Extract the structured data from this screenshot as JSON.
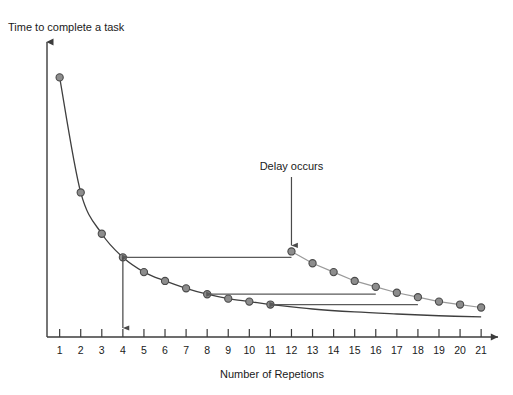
{
  "chart_data": {
    "type": "line",
    "title": "",
    "xlabel": "Number of Repetions",
    "ylabel": "Time to complete a task",
    "xlim": [
      0.4,
      21.8
    ],
    "ylim": [
      0,
      100
    ],
    "grid": false,
    "legend": "none",
    "x_tick_labels": [
      "1",
      "2",
      "3",
      "4",
      "5",
      "6",
      "7",
      "8",
      "9",
      "10",
      "11",
      "12",
      "13",
      "14",
      "15",
      "16",
      "17",
      "18",
      "19",
      "20",
      "21"
    ],
    "y_tick_labels": [],
    "series": [
      {
        "name": "Learning curve",
        "style": "line-with-markers",
        "color": "#3f3f3f",
        "x": [
          1,
          2,
          3,
          4,
          5,
          6,
          7,
          8,
          9,
          10,
          11
        ],
        "values": [
          88,
          49,
          35,
          27,
          22,
          19,
          16.5,
          14.5,
          13,
          12,
          11
        ]
      },
      {
        "name": "Curve after delay",
        "style": "line-with-markers",
        "color": "#9a9a9a",
        "x": [
          12,
          13,
          14,
          15,
          16,
          17,
          18,
          19,
          20,
          21
        ],
        "values": [
          29,
          25,
          22,
          19,
          17,
          15,
          13.5,
          12,
          11,
          10
        ]
      },
      {
        "name": "Continued baseline",
        "style": "line",
        "color": "#3f3f3f",
        "x": [
          11,
          13,
          15,
          17,
          19,
          21
        ],
        "values": [
          11,
          9.5,
          8.5,
          7.8,
          7.2,
          6.8
        ]
      }
    ],
    "annotations": [
      {
        "name": "delay-occurs",
        "text": "Delay occurs",
        "at_x": 12,
        "points_to_y": 29
      },
      {
        "name": "drop-line-x4",
        "text": "",
        "at_x": 4,
        "from_y": 27,
        "to_y": 0
      }
    ],
    "setback_arrows": [
      {
        "name": "setback-arrow-1",
        "from_x": 12,
        "to_x": 4,
        "at_y": 27
      },
      {
        "name": "setback-arrow-2",
        "from_x": 16,
        "to_x": 8,
        "at_y": 14.5
      },
      {
        "name": "setback-arrow-3",
        "from_x": 18,
        "to_x": 11,
        "at_y": 11
      }
    ]
  }
}
